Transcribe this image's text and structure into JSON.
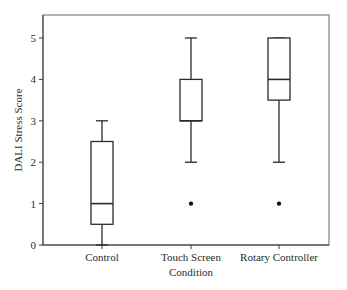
{
  "chart_data": {
    "type": "box",
    "title": "",
    "xlabel": "Condition",
    "ylabel": "DALI Stress Score",
    "ylim": [
      0,
      5.5
    ],
    "yticks": [
      0,
      1,
      2,
      3,
      4,
      5
    ],
    "grid": false,
    "legend": null,
    "categories": [
      "Control",
      "Touch Screen",
      "Rotary Controller"
    ],
    "series": [
      {
        "name": "Control",
        "whisker_low": 0,
        "q1": 0.5,
        "median": 1,
        "q3": 2.5,
        "whisker_high": 3,
        "outliers": []
      },
      {
        "name": "Touch Screen",
        "whisker_low": 2,
        "q1": 3,
        "median": 3,
        "q3": 4,
        "whisker_high": 5,
        "outliers": [
          1
        ]
      },
      {
        "name": "Rotary Controller",
        "whisker_low": 2,
        "q1": 3.5,
        "median": 4,
        "q3": 5,
        "whisker_high": 5,
        "outliers": [
          1
        ]
      }
    ]
  },
  "colors": {
    "box_stroke": "#2a2a2a",
    "box_fill": "#ffffff",
    "frame": "#6a6a6a",
    "outlier": "#111111"
  }
}
